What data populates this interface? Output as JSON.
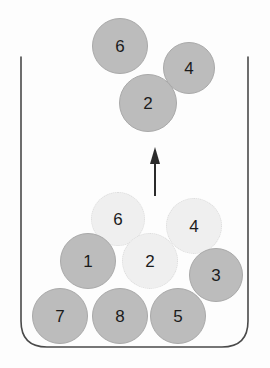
{
  "diagram": {
    "title": "",
    "container": {
      "name": "open-top-bin",
      "stroke_color": "#4a4a4a",
      "left_x": 21,
      "right_x": 248,
      "top_y": 57,
      "bottom_y": 347,
      "corner_radius": 26
    },
    "colors": {
      "ball_solid_fill": "#bcbcbc",
      "ball_solid_stroke": "#a9a9a9",
      "ball_faded_fill": "#efefef",
      "ball_faded_stroke": "#dcdcdc",
      "label_color": "#1b1b1b",
      "arrow_color": "#2b2b2b",
      "background": "#fdfdfd"
    },
    "arrow": {
      "name": "upward-motion-arrow",
      "direction": "up",
      "x": 155,
      "y_tail": 196,
      "y_head": 147,
      "stroke_width": 2
    },
    "balls": [
      {
        "label": "6",
        "state": "lifted",
        "cx": 120,
        "cy": 46,
        "r": 28
      },
      {
        "label": "4",
        "state": "lifted",
        "cx": 189,
        "cy": 68,
        "r": 26
      },
      {
        "label": "2",
        "state": "lifted",
        "cx": 148,
        "cy": 103,
        "r": 29
      },
      {
        "label": "6",
        "state": "ghost",
        "cx": 118,
        "cy": 219,
        "r": 27
      },
      {
        "label": "4",
        "state": "ghost",
        "cx": 194,
        "cy": 226,
        "r": 28
      },
      {
        "label": "1",
        "state": "settled",
        "cx": 88,
        "cy": 261,
        "r": 28
      },
      {
        "label": "2",
        "state": "ghost",
        "cx": 150,
        "cy": 261,
        "r": 28
      },
      {
        "label": "3",
        "state": "settled",
        "cx": 216,
        "cy": 275,
        "r": 27
      },
      {
        "label": "7",
        "state": "settled",
        "cx": 60,
        "cy": 316,
        "r": 28
      },
      {
        "label": "8",
        "state": "settled",
        "cx": 120,
        "cy": 316,
        "r": 28
      },
      {
        "label": "5",
        "state": "settled",
        "cx": 178,
        "cy": 316,
        "r": 28
      }
    ]
  }
}
